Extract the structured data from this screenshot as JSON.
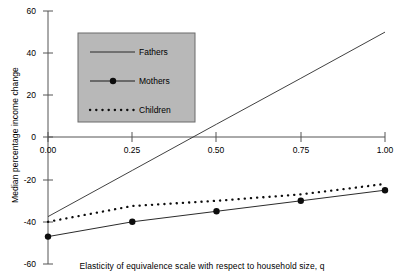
{
  "chart_data": {
    "type": "line",
    "title": "",
    "xlabel": "Elasticity of equivalence scale with respect to household size, q",
    "ylabel": "Median percentage income change",
    "xlim": [
      0.0,
      1.0
    ],
    "ylim": [
      -60,
      60
    ],
    "xticks": [
      0.0,
      0.25,
      0.5,
      0.75,
      1.0
    ],
    "xtick_labels": [
      "0.00",
      "0.25",
      "0.50",
      "0.75",
      "1.00"
    ],
    "yticks": [
      60,
      40,
      20,
      0,
      -20,
      -40,
      -60
    ],
    "ytick_labels": [
      "60",
      "40",
      "20",
      "0",
      "-20",
      "-40",
      "-60"
    ],
    "grid": false,
    "legend_position": "upper-left-inset",
    "series": [
      {
        "name": "Fathers",
        "style": "solid",
        "marker": "none",
        "color": "#000000",
        "x": [
          0.0,
          0.25,
          0.5,
          0.75,
          1.0
        ],
        "values": [
          -37.5,
          -15.6,
          6.3,
          28.1,
          50.0
        ]
      },
      {
        "name": "Mothers",
        "style": "solid",
        "marker": "filled-circle",
        "color": "#000000",
        "x": [
          0.0,
          0.25,
          0.5,
          0.75,
          1.0
        ],
        "values": [
          -47.0,
          -40.0,
          -35.0,
          -30.0,
          -25.0
        ]
      },
      {
        "name": "Children",
        "style": "dotted",
        "marker": "none",
        "color": "#000000",
        "x": [
          0.0,
          0.25,
          0.5,
          0.75,
          1.0
        ],
        "values": [
          -40.0,
          -32.5,
          -30.0,
          -27.0,
          -22.0
        ]
      }
    ]
  },
  "axes": {
    "x_title": "Elasticity of equivalence scale with respect to household size, q",
    "y_title": "Median percentage income change"
  },
  "legend": {
    "entries": [
      {
        "label": "Fathers"
      },
      {
        "label": "Mothers"
      },
      {
        "label": "Children"
      }
    ],
    "background_color": "#b8b8b8",
    "border_color": "#6b6b6b"
  },
  "colors": {
    "axis": "#555555",
    "line": "#1a1a1a",
    "background": "#ffffff"
  }
}
